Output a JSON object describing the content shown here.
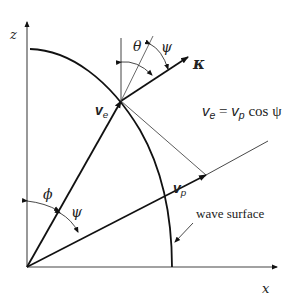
{
  "diagram": {
    "axes": {
      "x_label": "x",
      "z_label": "z"
    },
    "vectors": {
      "ve": {
        "symbol": "v",
        "subscript": "e"
      },
      "vp": {
        "symbol": "v",
        "subscript": "p"
      },
      "k": {
        "symbol": "κ"
      }
    },
    "angles": {
      "theta": "θ",
      "psi_top": "ψ",
      "phi": "ϕ",
      "psi_bottom": "ψ"
    },
    "equation": {
      "lhs_symbol": "v",
      "lhs_sub": "e",
      "equals": "=",
      "rhs_symbol": "v",
      "rhs_sub": "p",
      "rhs_func": "cos ψ"
    },
    "curve_label": "wave surface",
    "colors": {
      "line": "#111111",
      "thin_line": "#333333",
      "background": "#ffffff"
    }
  }
}
